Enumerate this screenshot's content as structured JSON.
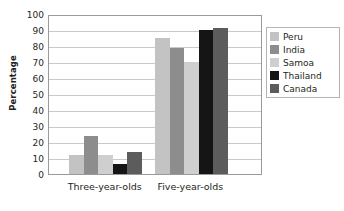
{
  "chart_data": {
    "type": "bar",
    "title": "",
    "subtitle": "",
    "xlabel": "",
    "ylabel": "Percentage",
    "ylim": [
      0,
      100
    ],
    "ytick_step": 10,
    "yticks": [
      100,
      90,
      80,
      70,
      60,
      50,
      40,
      30,
      20,
      10,
      0
    ],
    "grid": true,
    "grid_axis": "y",
    "legend_position": "right",
    "categories": [
      "Three-year-olds",
      "Five-year-olds"
    ],
    "series": [
      {
        "name": "Peru",
        "values": [
          12,
          85
        ],
        "color": "#c3c3c3"
      },
      {
        "name": "India",
        "values": [
          24,
          79
        ],
        "color": "#8d8d8d"
      },
      {
        "name": "Samoa",
        "values": [
          12,
          70
        ],
        "color": "#cfcfcf"
      },
      {
        "name": "Thailand",
        "values": [
          6,
          90
        ],
        "color": "#151515"
      },
      {
        "name": "Canada",
        "values": [
          14,
          91
        ],
        "color": "#5c5c5c"
      }
    ]
  },
  "axes": {
    "y_title": "Percentage",
    "y_labels": [
      "100",
      "90",
      "80",
      "70",
      "60",
      "50",
      "40",
      "30",
      "20",
      "10",
      "0"
    ],
    "x_labels": [
      "Three-year-olds",
      "Five-year-olds"
    ]
  },
  "legend": {
    "items": [
      {
        "label": "Peru",
        "swatch": "#c3c3c3"
      },
      {
        "label": "India",
        "swatch": "#8d8d8d"
      },
      {
        "label": "Samoa",
        "swatch": "#cfcfcf"
      },
      {
        "label": "Thailand",
        "swatch": "#151515"
      },
      {
        "label": "Canada",
        "swatch": "#5c5c5c"
      }
    ]
  },
  "style": {
    "plot_border": "#9a9a9a",
    "gridline": "#c9c9c9",
    "text": "#231f20",
    "background": "#ffffff"
  }
}
